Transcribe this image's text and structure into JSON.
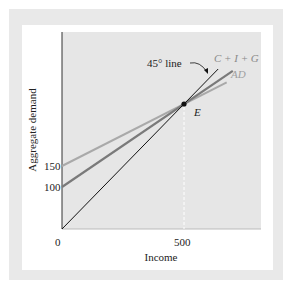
{
  "chart_data": {
    "type": "line",
    "title": "",
    "xlabel": "Income",
    "ylabel": "Aggregate demand",
    "x_ticks": [
      "0",
      "500"
    ],
    "y_ticks": [
      "100",
      "150"
    ],
    "grid": false,
    "series": [
      {
        "name": "45° line",
        "label": "45° line",
        "intercept": 0,
        "points": [
          [
            0,
            0
          ],
          [
            500,
            500
          ]
        ],
        "color": "#111111"
      },
      {
        "name": "C + I + G",
        "label": "C + I + G",
        "intercept": 100,
        "points": [
          [
            0,
            100
          ],
          [
            500,
            500
          ]
        ],
        "color": "#7a7a7a"
      },
      {
        "name": "AD",
        "label": "AD",
        "intercept": 150,
        "points": [
          [
            0,
            150
          ],
          [
            500,
            500
          ]
        ],
        "color": "#a9a9a9"
      }
    ],
    "annotations": [
      {
        "label": "E",
        "x": 500,
        "y": 500,
        "text": "Equilibrium point"
      }
    ],
    "equilibrium_income": 500
  },
  "labels": {
    "x_axis": "Income",
    "y_axis": "Aggregate demand",
    "tick_0": "0",
    "tick_500": "500",
    "tick_100": "100",
    "tick_150": "150",
    "line45": "45° line",
    "cig": "C + I + G",
    "ad": "AD",
    "e": "E"
  }
}
